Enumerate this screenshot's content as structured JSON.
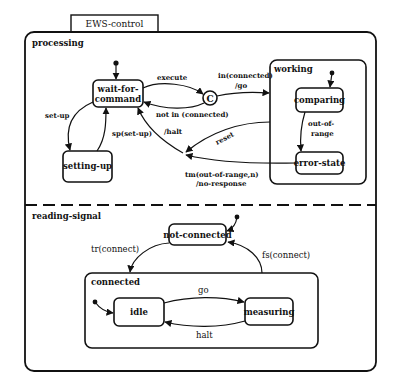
{
  "diagram": {
    "title": "EWS-control",
    "regions": {
      "processing": "processing",
      "reading_signal": "reading-signal"
    },
    "superstates": {
      "working": "working",
      "connected": "connected"
    },
    "states": {
      "wait_for_command_line1": "wait-for-",
      "wait_for_command_line2": "command",
      "setting_up": "setting-up",
      "comparing": "comparing",
      "error_state": "error-state",
      "not_connected": "not-connected",
      "idle": "idle",
      "measuring": "measuring"
    },
    "connector": "C",
    "transitions": {
      "execute": "execute",
      "in_connected_line1": "in(connected)",
      "in_connected_line2": "/go",
      "not_in_connected": "not in (connected)",
      "halt_action": "/halt",
      "reset": "reset",
      "set_up": "set-up",
      "sp_set_up": "sp(set-up)",
      "out_of_range_line1": "out-of-",
      "out_of_range_line2": "range",
      "tm_line1": "tm(out-of-range,n)",
      "tm_line2": "/no-response",
      "tr_connect": "tr(connect)",
      "fs_connect": "fs(connect)",
      "go": "go",
      "halt": "halt"
    },
    "colors": {
      "stroke": "#111111",
      "background": "#ffffff"
    }
  }
}
